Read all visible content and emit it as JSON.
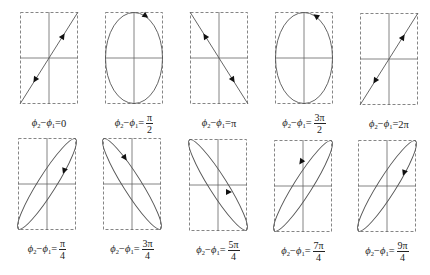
{
  "figure": {
    "colors": {
      "curve": "#555555",
      "axes": "#666666",
      "frame": "#777777",
      "arrow": "#111111",
      "text": "#222222"
    },
    "panels": [
      {
        "id": "p0",
        "row": 0,
        "x": 20,
        "y": 12,
        "shape": "line-pos",
        "arrows": "up-right",
        "label": {
          "lhs": "φ2−φ1=",
          "num": "0",
          "den": ""
        }
      },
      {
        "id": "p1",
        "row": 0,
        "x": 105,
        "y": 12,
        "shape": "ellipse",
        "arrows": "cw",
        "label": {
          "lhs": "φ2−φ1=",
          "num": "π",
          "den": "2"
        }
      },
      {
        "id": "p2",
        "row": 0,
        "x": 190,
        "y": 12,
        "shape": "line-neg",
        "arrows": "up-left",
        "label": {
          "lhs": "φ2−φ1=",
          "num": "π",
          "den": ""
        }
      },
      {
        "id": "p3",
        "row": 0,
        "x": 275,
        "y": 12,
        "shape": "ellipse",
        "arrows": "ccw",
        "label": {
          "lhs": "φ2−φ1=",
          "num": "3π",
          "den": "2"
        }
      },
      {
        "id": "p4",
        "row": 0,
        "x": 360,
        "y": 13,
        "shape": "line-pos",
        "arrows": "up-right",
        "label": {
          "lhs": "φ2−φ1=",
          "num": "2π",
          "den": ""
        }
      },
      {
        "id": "p5",
        "row": 1,
        "x": 18,
        "y": 138,
        "shape": "ellipse-pos",
        "arrows": "cw",
        "label": {
          "lhs": "φ2−φ1=",
          "num": "π",
          "den": "4"
        }
      },
      {
        "id": "p6",
        "row": 1,
        "x": 103,
        "y": 138,
        "shape": "ellipse-neg",
        "arrows": "cw",
        "label": {
          "lhs": "φ2−φ1=",
          "num": "3π",
          "den": "4"
        }
      },
      {
        "id": "p7",
        "row": 1,
        "x": 189,
        "y": 139,
        "shape": "ellipse-neg",
        "arrows": "ccw",
        "label": {
          "lhs": "φ2−φ1=",
          "num": "5π",
          "den": "4"
        }
      },
      {
        "id": "p8",
        "row": 1,
        "x": 274,
        "y": 140,
        "shape": "ellipse-pos",
        "arrows": "ccw",
        "label": {
          "lhs": "φ2−φ1=",
          "num": "7π",
          "den": "4"
        }
      },
      {
        "id": "p9",
        "row": 1,
        "x": 358,
        "y": 140,
        "shape": "ellipse-pos",
        "arrows": "cw",
        "label": {
          "lhs": "φ2−φ1=",
          "num": "9π",
          "den": "4"
        }
      }
    ]
  }
}
